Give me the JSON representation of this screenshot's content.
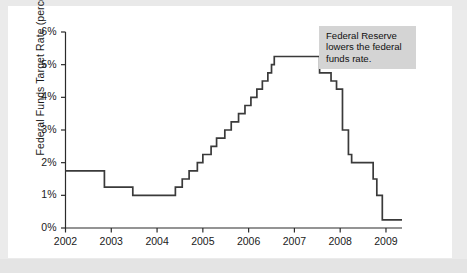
{
  "chart_data": {
    "type": "line",
    "title": "",
    "subtitle": "",
    "xlabel": "",
    "ylabel": "Federal Funds Target Rate (percent)",
    "xlim": [
      2002.0,
      2009.35
    ],
    "ylim": [
      0,
      6
    ],
    "grid": false,
    "legend": null,
    "x_tick_labels": [
      "2002",
      "2003",
      "2004",
      "2005",
      "2006",
      "2007",
      "2008",
      "2009"
    ],
    "x_tick_values": [
      2002,
      2003,
      2004,
      2005,
      2006,
      2007,
      2008,
      2009
    ],
    "y_tick_labels": [
      "0%",
      "1%",
      "2%",
      "3%",
      "4%",
      "5%",
      "6%"
    ],
    "y_tick_values": [
      0,
      1,
      2,
      3,
      4,
      5,
      6
    ],
    "line_color": "#3a3a3a",
    "step_style": "post",
    "annotations": [
      {
        "text": "Federal Reserve lowers the federal funds rate.",
        "lines": [
          "Federal Reserve",
          "lowers the federal",
          "funds rate."
        ],
        "x": 2007.55,
        "y": 5.6,
        "background": "#d4d4d4"
      }
    ],
    "series": [
      {
        "name": "Federal Funds Target Rate",
        "points": [
          {
            "x": 2002.0,
            "y": 1.75
          },
          {
            "x": 2002.85,
            "y": 1.75
          },
          {
            "x": 2002.85,
            "y": 1.25
          },
          {
            "x": 2003.47,
            "y": 1.25
          },
          {
            "x": 2003.47,
            "y": 1.0
          },
          {
            "x": 2004.4,
            "y": 1.0
          },
          {
            "x": 2004.4,
            "y": 1.25
          },
          {
            "x": 2004.55,
            "y": 1.25
          },
          {
            "x": 2004.55,
            "y": 1.5
          },
          {
            "x": 2004.7,
            "y": 1.5
          },
          {
            "x": 2004.7,
            "y": 1.75
          },
          {
            "x": 2004.88,
            "y": 1.75
          },
          {
            "x": 2004.88,
            "y": 2.0
          },
          {
            "x": 2005.0,
            "y": 2.0
          },
          {
            "x": 2005.0,
            "y": 2.25
          },
          {
            "x": 2005.18,
            "y": 2.25
          },
          {
            "x": 2005.18,
            "y": 2.5
          },
          {
            "x": 2005.3,
            "y": 2.5
          },
          {
            "x": 2005.3,
            "y": 2.75
          },
          {
            "x": 2005.48,
            "y": 2.75
          },
          {
            "x": 2005.48,
            "y": 3.0
          },
          {
            "x": 2005.62,
            "y": 3.0
          },
          {
            "x": 2005.62,
            "y": 3.25
          },
          {
            "x": 2005.78,
            "y": 3.25
          },
          {
            "x": 2005.78,
            "y": 3.5
          },
          {
            "x": 2005.92,
            "y": 3.5
          },
          {
            "x": 2005.92,
            "y": 3.75
          },
          {
            "x": 2006.05,
            "y": 3.75
          },
          {
            "x": 2006.05,
            "y": 4.0
          },
          {
            "x": 2006.18,
            "y": 4.0
          },
          {
            "x": 2006.18,
            "y": 4.25
          },
          {
            "x": 2006.3,
            "y": 4.25
          },
          {
            "x": 2006.3,
            "y": 4.5
          },
          {
            "x": 2006.42,
            "y": 4.5
          },
          {
            "x": 2006.42,
            "y": 4.75
          },
          {
            "x": 2006.5,
            "y": 4.75
          },
          {
            "x": 2006.5,
            "y": 5.0
          },
          {
            "x": 2006.56,
            "y": 5.0
          },
          {
            "x": 2006.56,
            "y": 5.25
          },
          {
            "x": 2007.55,
            "y": 5.25
          },
          {
            "x": 2007.55,
            "y": 4.75
          },
          {
            "x": 2007.8,
            "y": 4.75
          },
          {
            "x": 2007.8,
            "y": 4.5
          },
          {
            "x": 2007.92,
            "y": 4.5
          },
          {
            "x": 2007.92,
            "y": 4.25
          },
          {
            "x": 2008.05,
            "y": 4.25
          },
          {
            "x": 2008.05,
            "y": 3.0
          },
          {
            "x": 2008.18,
            "y": 3.0
          },
          {
            "x": 2008.18,
            "y": 2.25
          },
          {
            "x": 2008.25,
            "y": 2.25
          },
          {
            "x": 2008.25,
            "y": 2.0
          },
          {
            "x": 2008.72,
            "y": 2.0
          },
          {
            "x": 2008.72,
            "y": 1.5
          },
          {
            "x": 2008.8,
            "y": 1.5
          },
          {
            "x": 2008.8,
            "y": 1.0
          },
          {
            "x": 2008.92,
            "y": 1.0
          },
          {
            "x": 2008.92,
            "y": 0.25
          },
          {
            "x": 2009.35,
            "y": 0.25
          }
        ]
      }
    ],
    "notable_values": {
      "start_rate_2002": 1.75,
      "trough_rate": 1.0,
      "peak_rate": 5.25,
      "end_rate": 0.25
    }
  }
}
